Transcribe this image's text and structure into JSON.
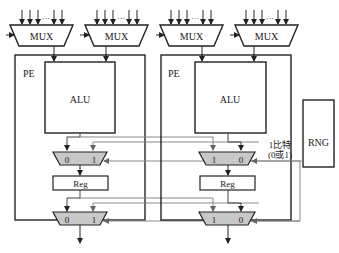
{
  "diagram": {
    "mux_labels": [
      "MUX",
      "MUX",
      "MUX",
      "MUX"
    ],
    "mux_input_ellipsis": "···",
    "pe": [
      {
        "label": "PE",
        "alu_label": "ALU",
        "reg_label": "Reg",
        "mux2_top": {
          "left": "0",
          "right": "1"
        },
        "mux2_bottom": {
          "left": "0",
          "right": "1"
        }
      },
      {
        "label": "PE",
        "alu_label": "ALU",
        "reg_label": "Reg",
        "mux2_top": {
          "left": "1",
          "right": "0"
        },
        "mux2_bottom": {
          "left": "1",
          "right": "0"
        }
      }
    ],
    "rng_label": "RNG",
    "rng_annotation_line1": "1比特",
    "rng_annotation_line2": "(0或1)",
    "colors": {
      "stroke": "#222222",
      "mux2_fill": "#c8c8c8",
      "wire_gray": "#777777"
    }
  }
}
